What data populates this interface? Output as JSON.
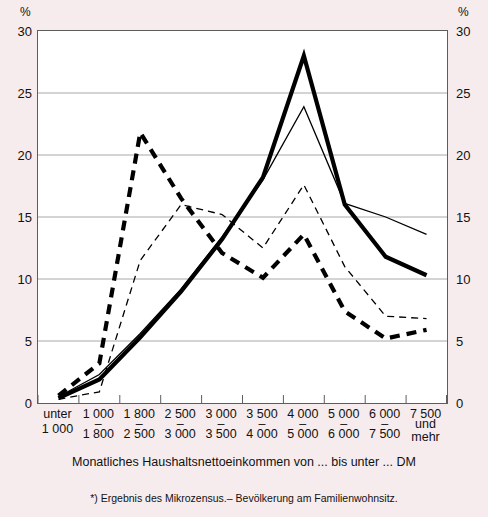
{
  "axes": {
    "y_unit": "%",
    "y_ticks": [
      0,
      5,
      10,
      15,
      20,
      25,
      30
    ],
    "y_tick_labels": [
      "0",
      "5",
      "10",
      "15",
      "20",
      "25",
      "30"
    ]
  },
  "captions": {
    "x_axis": "Monatliches Haushaltsnettoeinkommen von ... bis unter ... DM",
    "source": "*) Ergebnis des Mikrozensus.– Bevölkerung am Familienwohnsitz."
  },
  "categories_display": [
    {
      "upper": "unter",
      "lower": "1 000",
      "dash": false
    },
    {
      "upper": "1 000",
      "lower": "1 800",
      "dash": true
    },
    {
      "upper": "1 800",
      "lower": "2 500",
      "dash": true
    },
    {
      "upper": "2 500",
      "lower": "3 000",
      "dash": true
    },
    {
      "upper": "3 000",
      "lower": "3 500",
      "dash": true
    },
    {
      "upper": "3 500",
      "lower": "4 000",
      "dash": true
    },
    {
      "upper": "4 000",
      "lower": "5 000",
      "dash": true
    },
    {
      "upper": "5 000",
      "lower": "6 000",
      "dash": true
    },
    {
      "upper": "6 000",
      "lower": "7 500",
      "dash": true
    },
    {
      "upper": "7 500",
      "lower": "und mehr",
      "dash": false
    }
  ],
  "chart_data": {
    "type": "line",
    "title": "",
    "xlabel": "Monatliches Haushaltsnettoeinkommen von ... bis unter ... DM",
    "ylabel": "%",
    "ylim": [
      0,
      30
    ],
    "grid": true,
    "legend": "none",
    "categories": [
      "unter 1 000",
      "1 000 - 1 800",
      "1 800 - 2 500",
      "2 500 - 3 000",
      "3 000 - 3 500",
      "3 500 - 4 000",
      "4 000 - 5 000",
      "5 000 - 6 000",
      "6 000 - 7 500",
      "7 500 und mehr"
    ],
    "series": [
      {
        "name": "thick-solid",
        "style": "solid",
        "width": "thick",
        "color": "#000000",
        "values": [
          0.4,
          1.9,
          5.3,
          9.0,
          13.2,
          18.2,
          28.0,
          16.0,
          11.8,
          10.3
        ]
      },
      {
        "name": "thin-solid",
        "style": "solid",
        "width": "thin",
        "color": "#000000",
        "values": [
          0.5,
          2.3,
          5.6,
          9.2,
          13.4,
          18.0,
          23.9,
          16.1,
          15.0,
          13.6
        ]
      },
      {
        "name": "thick-dashed",
        "style": "dashed",
        "width": "thick",
        "color": "#000000",
        "values": [
          0.6,
          3.2,
          21.8,
          16.5,
          12.1,
          10.1,
          13.6,
          7.4,
          5.2,
          5.9
        ]
      },
      {
        "name": "thin-dashed",
        "style": "dashed",
        "width": "thin",
        "color": "#000000",
        "values": [
          0.3,
          0.9,
          11.5,
          16.0,
          15.2,
          12.5,
          17.6,
          11.0,
          7.0,
          6.8
        ]
      }
    ]
  },
  "colors": {
    "background": "#f7eced",
    "plot_background": "#ffffff",
    "grid": "#a8a8a8",
    "axis": "#5d5d5d",
    "line": "#000000"
  }
}
